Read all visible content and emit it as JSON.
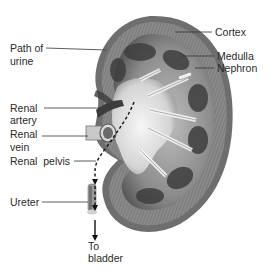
{
  "diagram": {
    "labels": {
      "cortex": "Cortex",
      "medulla": "Medulla",
      "nephron": "Nephron",
      "path_of_urine_line1": "Path of",
      "path_of_urine_line2": "urine",
      "renal_artery_line1": "Renal",
      "renal_artery_line2": "artery",
      "renal_vein_line1": "Renal",
      "renal_vein_line2": "vein",
      "renal_pelvis": "Renal  pelvis",
      "ureter": "Ureter",
      "to_bladder_line1": "To",
      "to_bladder_line2": "bladder"
    },
    "colors": {
      "background": "#ffffff",
      "kidney_outer": "#6e6e6e",
      "kidney_cortex": "#9a9a9a",
      "medulla_dark": "#3e3e3e",
      "pelvis_light": "#e6e6e6",
      "label_text": "#2a2a2a",
      "leader_line": "#333333"
    }
  }
}
